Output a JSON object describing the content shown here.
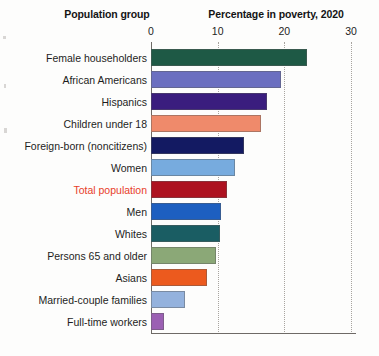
{
  "headers": {
    "group_column": "Population group",
    "value_column": "Percentage in poverty, 2020"
  },
  "axis": {
    "ticks": [
      "0",
      "10",
      "20",
      "30"
    ],
    "tick_values": [
      0,
      10,
      20,
      30
    ],
    "min": 0,
    "max": 30
  },
  "colors": {
    "female_householders": "#1e5945",
    "african_americans": "#6b6fc0",
    "hispanics": "#3a1d7e",
    "children_under_18": "#ef8a6b",
    "foreign_born": "#131a62",
    "women": "#77abde",
    "total_population": "#ad1220",
    "men": "#1d5fc0",
    "whites": "#1a5d63",
    "persons_65_and_older": "#8ba877",
    "asians": "#ec5a1e",
    "married_couple_families": "#94b2dd",
    "full_time_workers": "#9b60b3",
    "highlight_label": "#e8402a",
    "gridline": "#a8a49f",
    "axis_line": "#6e6a66"
  },
  "chart_data": {
    "type": "bar",
    "orientation": "horizontal",
    "title": "Percentage in poverty, 2020",
    "xlabel": "Percentage in poverty, 2020",
    "ylabel": "Population group",
    "xlim": [
      0,
      30
    ],
    "grid": true,
    "legend": "none",
    "categories": [
      "Female householders",
      "African Americans",
      "Hispanics",
      "Children under 18",
      "Foreign-born (noncitizens)",
      "Women",
      "Total population",
      "Men",
      "Whites",
      "Persons 65 and older",
      "Asians",
      "Married-couple families",
      "Full-time workers"
    ],
    "values": [
      23.4,
      19.5,
      17.4,
      16.5,
      13.9,
      12.6,
      11.4,
      10.5,
      10.3,
      9.7,
      8.4,
      5.1,
      2.0
    ],
    "bars": [
      {
        "label": "Female householders",
        "value": 23.4,
        "color": "#1e5945",
        "highlight": false
      },
      {
        "label": "African Americans",
        "value": 19.5,
        "color": "#6b6fc0",
        "highlight": false
      },
      {
        "label": "Hispanics",
        "value": 17.4,
        "color": "#3a1d7e",
        "highlight": false
      },
      {
        "label": "Children under 18",
        "value": 16.5,
        "color": "#ef8a6b",
        "highlight": false
      },
      {
        "label": "Foreign-born (noncitizens)",
        "value": 13.9,
        "color": "#131a62",
        "highlight": false
      },
      {
        "label": "Women",
        "value": 12.6,
        "color": "#77abde",
        "highlight": false
      },
      {
        "label": "Total population",
        "value": 11.4,
        "color": "#ad1220",
        "highlight": true
      },
      {
        "label": "Men",
        "value": 10.5,
        "color": "#1d5fc0",
        "highlight": false
      },
      {
        "label": "Whites",
        "value": 10.3,
        "color": "#1a5d63",
        "highlight": false
      },
      {
        "label": "Persons 65 and older",
        "value": 9.7,
        "color": "#8ba877",
        "highlight": false
      },
      {
        "label": "Asians",
        "value": 8.4,
        "color": "#ec5a1e",
        "highlight": false
      },
      {
        "label": "Married-couple families",
        "value": 5.1,
        "color": "#94b2dd",
        "highlight": false
      },
      {
        "label": "Full-time workers",
        "value": 2.0,
        "color": "#9b60b3",
        "highlight": false
      }
    ]
  }
}
